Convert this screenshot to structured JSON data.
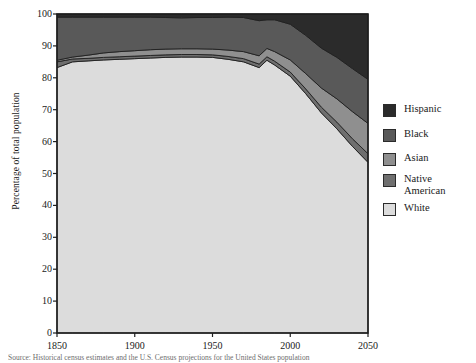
{
  "figure": {
    "ylabel": "Percentage of total population",
    "source_note": "Source: Historical census estimates and the U.S. Census projections for the United States population"
  },
  "legend": {
    "position": "right",
    "items": [
      {
        "label": "Hispanic",
        "color": "#2b2b2b",
        "name": "legend-item-hispanic"
      },
      {
        "label": "Black",
        "color": "#595959",
        "name": "legend-item-black"
      },
      {
        "label": "Asian",
        "color": "#8f8f8f",
        "name": "legend-item-asian"
      },
      {
        "label": "Native\nAmerican",
        "color": "#6f6f6f",
        "name": "legend-item-native-american"
      },
      {
        "label": "White",
        "color": "#dcdcdc",
        "name": "legend-item-white"
      }
    ]
  },
  "axes": {
    "y_ticks": [
      "100",
      "90",
      "80",
      "70",
      "60",
      "50",
      "40",
      "30",
      "20",
      "10",
      "0"
    ],
    "x_ticks": [
      "1850",
      "1900",
      "1950",
      "2000",
      "2050"
    ]
  },
  "chart_data": {
    "type": "area",
    "title": "",
    "xlabel": "",
    "ylabel": "Percentage of total population",
    "xlim": [
      1850,
      2050
    ],
    "ylim": [
      0,
      100
    ],
    "grid": false,
    "legend_position": "right",
    "stacked": true,
    "stack_order_bottom_to_top": [
      "White",
      "Native American",
      "Asian",
      "Black",
      "Hispanic"
    ],
    "x": [
      1850,
      1860,
      1870,
      1880,
      1890,
      1900,
      1910,
      1920,
      1930,
      1940,
      1950,
      1960,
      1970,
      1980,
      1985,
      1990,
      2000,
      2010,
      2020,
      2030,
      2040,
      2050
    ],
    "series": [
      {
        "name": "White",
        "color": "#dcdcdc",
        "values": [
          83.2,
          85.0,
          85.3,
          85.6,
          85.8,
          86.0,
          86.2,
          86.4,
          86.5,
          86.5,
          86.4,
          85.8,
          85.0,
          83.2,
          85.5,
          84.0,
          80.5,
          75.0,
          69.0,
          64.0,
          58.5,
          53.5
        ]
      },
      {
        "name": "Native American",
        "color": "#6f6f6f",
        "values": [
          1.8,
          0.9,
          0.8,
          0.8,
          0.8,
          0.8,
          0.8,
          0.8,
          0.8,
          0.8,
          0.8,
          0.9,
          1.0,
          1.1,
          1.1,
          1.2,
          1.3,
          1.5,
          1.8,
          2.1,
          2.4,
          2.7
        ]
      },
      {
        "name": "Asian",
        "color": "#8f8f8f",
        "values": [
          0.5,
          0.6,
          1.0,
          1.4,
          1.6,
          1.7,
          1.8,
          1.8,
          1.8,
          1.8,
          1.8,
          2.0,
          2.2,
          2.6,
          2.6,
          3.0,
          3.8,
          4.8,
          6.0,
          7.3,
          8.5,
          9.5
        ]
      },
      {
        "name": "Black",
        "color": "#595959",
        "values": [
          13.5,
          12.5,
          11.9,
          11.2,
          10.8,
          10.5,
          10.2,
          9.9,
          9.7,
          9.8,
          9.9,
          10.3,
          10.7,
          11.0,
          9.0,
          10.0,
          11.2,
          12.0,
          12.5,
          13.0,
          13.5,
          13.8
        ]
      },
      {
        "name": "Hispanic",
        "color": "#2b2b2b",
        "values": [
          1.0,
          1.0,
          1.0,
          1.0,
          1.0,
          1.0,
          1.0,
          1.1,
          1.2,
          1.1,
          1.1,
          1.0,
          1.1,
          2.1,
          1.8,
          1.8,
          3.2,
          6.7,
          10.7,
          13.6,
          17.1,
          20.5
        ]
      }
    ]
  }
}
